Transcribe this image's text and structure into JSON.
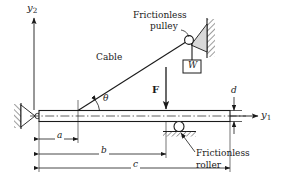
{
  "figure": {
    "type": "engineering-free-body-diagram",
    "background_color": "#ffffff",
    "line_color": "#1a1a1a",
    "hatch_color": "#555555",
    "beam_fill": "#ffffff",
    "pulley_bracket_fill": "#d9d9d9"
  },
  "axes": {
    "vertical": {
      "label": "y",
      "subscript": "2"
    },
    "horizontal": {
      "label": "y",
      "subscript": "1"
    }
  },
  "labels": {
    "pulley_line1": "Frictionless",
    "pulley_line2": "pulley",
    "cable": "Cable",
    "weight": "W",
    "force": "F",
    "angle": "θ",
    "roller_line1": "Frictionless",
    "roller_line2": "roller"
  },
  "dimensions": [
    {
      "name": "d",
      "label": "d",
      "orientation": "vertical",
      "measures": "beam-depth-at-right-end"
    },
    {
      "name": "a",
      "label": "a",
      "orientation": "horizontal",
      "measures": "pin-to-cable-attachment"
    },
    {
      "name": "b",
      "label": "b",
      "orientation": "horizontal",
      "measures": "pin-to-applied-force"
    },
    {
      "name": "c",
      "label": "c",
      "orientation": "horizontal",
      "measures": "pin-to-beam-right-end"
    }
  ]
}
